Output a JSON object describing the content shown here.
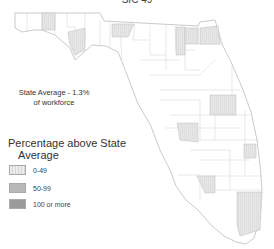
{
  "title": "SIC 49",
  "state_average": {
    "line1": "State Average - 1.3%",
    "line2": "of workforce"
  },
  "legend": {
    "title_line1": "Percentage above State",
    "title_line2": "Average",
    "items": [
      {
        "label": "0-49",
        "color": "#e4e4e4",
        "pattern": "hatched-light"
      },
      {
        "label": "50-99",
        "color": "#b9b9b9"
      },
      {
        "label": "100 or more",
        "color": "#9a9a9a"
      }
    ]
  },
  "map": {
    "region": "Florida counties",
    "outline_color": "#c8c8c8",
    "shaded_counties_category": "0-49",
    "shaded_count": 11
  }
}
